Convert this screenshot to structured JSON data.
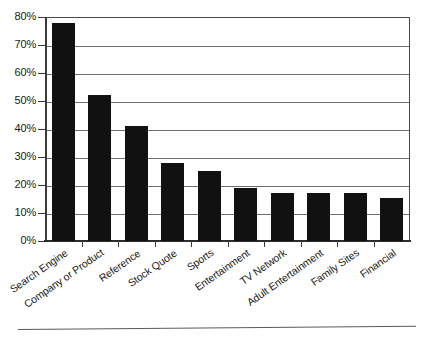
{
  "chart_data": {
    "type": "bar",
    "title": "",
    "subtitle": "",
    "xlabel": "",
    "ylabel": "",
    "categories": [
      "Search Engine",
      "Company or Product",
      "Reference",
      "Stock Quote",
      "Sports",
      "Entertainment",
      "TV Network",
      "Adult Entertainment",
      "Family Sites",
      "Financial"
    ],
    "values": [
      78,
      52,
      41,
      28,
      25,
      19,
      17,
      17,
      17,
      15.5
    ],
    "value_suffix": "%",
    "ylim": [
      0,
      80
    ],
    "ytick_values": [
      0,
      10,
      20,
      30,
      40,
      50,
      60,
      70,
      80
    ],
    "ytick_labels": [
      "0%",
      "10%",
      "20%",
      "30%",
      "40%",
      "50%",
      "60%",
      "70%",
      "80%"
    ],
    "grid": true,
    "grid_axis": "y",
    "legend": false,
    "legend_position": "none",
    "bar_color": "#111111",
    "grid_color": "#6d6d6d",
    "axis_color": "#3a3a3a",
    "background_color": "#ffffff",
    "xtick_label_rotation": -35
  }
}
